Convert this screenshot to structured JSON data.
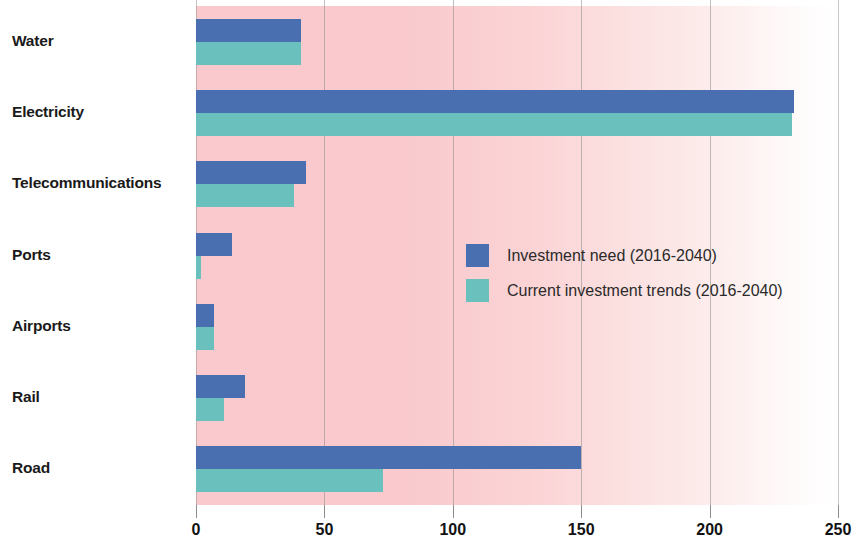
{
  "chart_data": {
    "type": "bar",
    "orientation": "horizontal",
    "title": "",
    "subtitle": "",
    "xlabel": "",
    "ylabel": "",
    "xlim": [
      0,
      250
    ],
    "xticks": [
      0,
      50,
      100,
      150,
      200,
      250
    ],
    "xtick_labels": [
      "0",
      "50",
      "100",
      "150",
      "200",
      "250"
    ],
    "grid": "vertical",
    "legend_position": "middle-right-inside",
    "categories": [
      "Water",
      "Electricity",
      "Telecommunications",
      "Ports",
      "Airports",
      "Rail",
      "Road"
    ],
    "series": [
      {
        "name": "Investment need (2016-2040)",
        "color": "#4a6fb0",
        "values": [
          41,
          233,
          43,
          14,
          7,
          19,
          150
        ]
      },
      {
        "name": "Current investment trends (2016-2040)",
        "color": "#69c0bd",
        "values": [
          41,
          232,
          38,
          2,
          7,
          11,
          73
        ]
      }
    ],
    "plot_background_start_color": "#f9c9cd",
    "plot_background_end_color": "#ffffff"
  },
  "legend": {
    "items": [
      {
        "label": "Investment need (2016-2040)",
        "swatch": "need"
      },
      {
        "label": "Current investment trends (2016-2040)",
        "swatch": "trend"
      }
    ]
  }
}
